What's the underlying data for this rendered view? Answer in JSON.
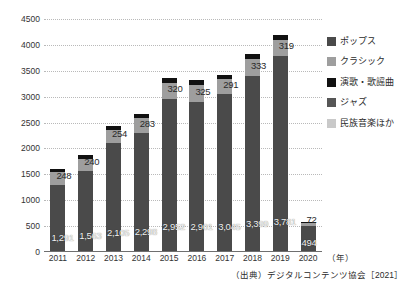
{
  "chart_data": {
    "type": "bar",
    "subtype": "stacked-bar",
    "title": "",
    "xlabel": "(年)",
    "ylabel": "",
    "ylim": [
      0,
      4500
    ],
    "ystep": 500,
    "yticks": [
      "0",
      "500",
      "1000",
      "1500",
      "2000",
      "2500",
      "3000",
      "3500",
      "4000",
      "4500"
    ],
    "grid": true,
    "legend_position": "right",
    "categories": [
      "2011",
      "2012",
      "2013",
      "2014",
      "2015",
      "2016",
      "2017",
      "2018",
      "2019",
      "2020"
    ],
    "series": [
      {
        "name": "ポップス",
        "color": "#4a4a4a",
        "values": [
          1291,
          1563,
          2105,
          2298,
          2952,
          2901,
          3045,
          3399,
          3781,
          494
        ]
      },
      {
        "name": "クラシック",
        "color": "#9e9e9e",
        "values": [
          248,
          240,
          254,
          283,
          320,
          325,
          291,
          333,
          319,
          72
        ]
      },
      {
        "name": "演歌・歌謡曲",
        "color": "#111111",
        "values": [
          70,
          75,
          80,
          85,
          95,
          95,
          90,
          100,
          95,
          20
        ]
      },
      {
        "name": "ジャズ",
        "color": "#565656",
        "values": [
          0,
          0,
          0,
          0,
          0,
          0,
          0,
          0,
          0,
          0
        ]
      },
      {
        "name": "民族音楽ほか",
        "color": "#c9c9c9",
        "values": [
          0,
          0,
          0,
          0,
          0,
          0,
          0,
          0,
          0,
          0
        ]
      }
    ],
    "bar_labels_main": [
      "1,291",
      "1,563",
      "2,105",
      "2,298",
      "2,952",
      "2,901",
      "3,045",
      "3,399",
      "3,781",
      "494"
    ],
    "bar_labels_top": [
      "248",
      "240",
      "254",
      "283",
      "320",
      "325",
      "291",
      "333",
      "319",
      "72"
    ],
    "source": "（出典）デジタルコンテンツ協会［2021］"
  },
  "legend": {
    "items": [
      {
        "label": "ポップス",
        "color": "#4a4a4a"
      },
      {
        "label": "クラシック",
        "color": "#9e9e9e"
      },
      {
        "label": "演歌・歌謡曲",
        "color": "#111111"
      },
      {
        "label": "ジャズ",
        "color": "#565656"
      },
      {
        "label": "民族音楽ほか",
        "color": "#c9c9c9"
      }
    ]
  },
  "axes": {
    "x_unit": "（年）"
  },
  "footer": {
    "source": "（出典）デジタルコンテンツ協会［2021］"
  },
  "top_clipped": {
    "left_fragment": "",
    "right_fragment": ""
  }
}
